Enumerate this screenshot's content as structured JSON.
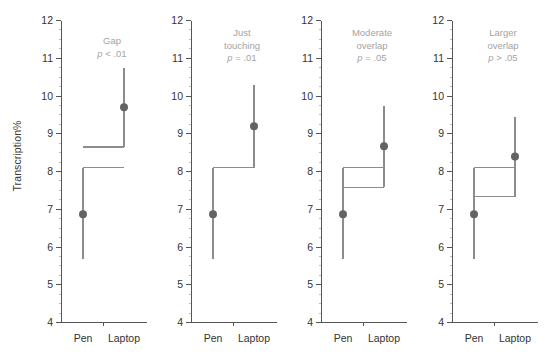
{
  "figure": {
    "ylabel": "Transcription%",
    "y_ticks": [
      "12",
      "11",
      "10",
      "9",
      "8",
      "7",
      "6",
      "5",
      "4"
    ],
    "x_ticks": [
      "Pen",
      "Laptop"
    ],
    "colors": {
      "marker": "#636363",
      "line": "#8c8c8c",
      "axis": "#555555",
      "annotation": "#a3a3a3",
      "tick_text": "#333333"
    }
  },
  "chart_data": {
    "type": "scatter",
    "title": "",
    "subtitle": "",
    "xlabel": "",
    "ylabel": "Transcription%",
    "ylim": [
      4,
      12
    ],
    "ytick_values": [
      4,
      5,
      6,
      7,
      8,
      9,
      10,
      11,
      12
    ],
    "yminor_step": 0.25,
    "grid": false,
    "legend": null,
    "categories": [
      "Pen",
      "Laptop"
    ],
    "panels": [
      {
        "label": "Gap",
        "p_text": "p < .01",
        "annotation_lines": [
          "Gap",
          "p < .01"
        ],
        "points": [
          {
            "category": "Pen",
            "mean": 6.87,
            "ci_low": 5.67,
            "ci_high": 8.1
          },
          {
            "category": "Laptop",
            "mean": 9.7,
            "ci_low": 8.65,
            "ci_high": 10.75
          }
        ],
        "connector": {
          "pen_ci_high": 8.1,
          "laptop_ci_low": 8.65,
          "overlap": "gap"
        }
      },
      {
        "label": "Just touching",
        "p_text": "p = .01",
        "annotation_lines": [
          "Just",
          "touching",
          "p = .01"
        ],
        "points": [
          {
            "category": "Pen",
            "mean": 6.87,
            "ci_low": 5.67,
            "ci_high": 8.1
          },
          {
            "category": "Laptop",
            "mean": 9.2,
            "ci_low": 8.1,
            "ci_high": 10.3
          }
        ],
        "connector": {
          "pen_ci_high": 8.1,
          "laptop_ci_low": 8.1,
          "overlap": "touching"
        }
      },
      {
        "label": "Moderate overlap",
        "p_text": "p = .05",
        "annotation_lines": [
          "Moderate",
          "overlap",
          "p = .05"
        ],
        "points": [
          {
            "category": "Pen",
            "mean": 6.87,
            "ci_low": 5.67,
            "ci_high": 8.1
          },
          {
            "category": "Laptop",
            "mean": 8.67,
            "ci_low": 7.58,
            "ci_high": 9.73
          }
        ],
        "connector": {
          "pen_ci_high": 8.1,
          "laptop_ci_low": 7.58,
          "overlap": "moderate"
        }
      },
      {
        "label": "Larger overlap",
        "p_text": "p > .05",
        "annotation_lines": [
          "Larger",
          "overlap",
          "p > .05"
        ],
        "points": [
          {
            "category": "Pen",
            "mean": 6.87,
            "ci_low": 5.67,
            "ci_high": 8.1
          },
          {
            "category": "Laptop",
            "mean": 8.4,
            "ci_low": 7.33,
            "ci_high": 9.45
          }
        ],
        "connector": {
          "pen_ci_high": 8.1,
          "laptop_ci_low": 7.33,
          "overlap": "larger"
        }
      }
    ]
  }
}
